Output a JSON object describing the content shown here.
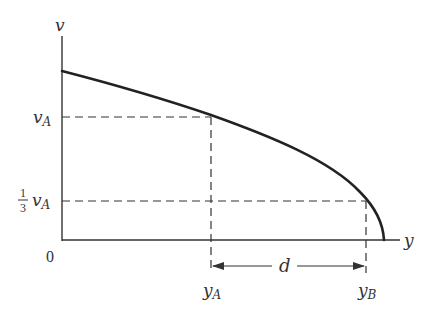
{
  "diagram": {
    "type": "velocity-position graph",
    "axes": {
      "vertical_label": "v",
      "horizontal_label": "y",
      "origin_label": "0"
    },
    "levels": {
      "vA_label": "v",
      "vA_sub": "A",
      "third_vA_num": "1",
      "third_vA_den": "3",
      "third_vA_var": "v",
      "third_vA_sub": "A"
    },
    "positions": {
      "yA_label": "y",
      "yA_sub": "A",
      "yB_label": "y",
      "yB_sub": "B"
    },
    "distance_label": "d",
    "colors": {
      "line": "#222222",
      "text": "#333333"
    }
  }
}
